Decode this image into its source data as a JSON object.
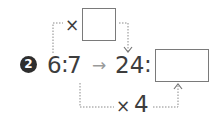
{
  "problem": {
    "number": "2",
    "left_ratio": {
      "a": "6",
      "sep": ":",
      "b": "7"
    },
    "arrow": "→",
    "right_ratio": {
      "a": "24",
      "sep": ":",
      "b_blank": ""
    },
    "top_operator": {
      "symbol": "×",
      "blank": ""
    },
    "bottom_operator": {
      "symbol": "×",
      "value": "4"
    }
  },
  "colors": {
    "text": "#3d3d3d",
    "arrow": "#9a9a9a",
    "dotted": "#8a8a8a",
    "badge": "#2e2e2e",
    "box_border": "#7a7a7a"
  }
}
